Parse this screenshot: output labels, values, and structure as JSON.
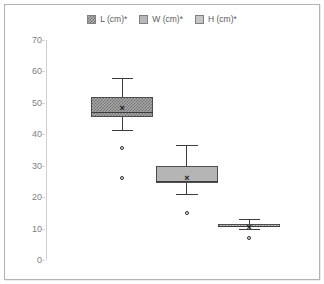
{
  "chart_data": {
    "type": "box",
    "title": "",
    "xlabel": "",
    "ylabel": "",
    "ylim": [
      0,
      70
    ],
    "ytick_labels": [
      "70",
      "60",
      "50",
      "40",
      "30",
      "20",
      "10",
      "0"
    ],
    "ytick_values": [
      70,
      60,
      50,
      40,
      30,
      20,
      10,
      0
    ],
    "grid": false,
    "legend_position": "top-center",
    "categories": [
      "L (cm)*",
      "W (cm)*",
      "H (cm)*"
    ],
    "series": [
      {
        "name": "L (cm)*",
        "whisker_low": 41.5,
        "q1": 45.5,
        "median": 47.0,
        "q3": 52.0,
        "whisker_high": 58.0,
        "mean": 48.5,
        "outliers": [
          35.5,
          26.0
        ],
        "fill": "#a8a8a8",
        "pattern": "checker"
      },
      {
        "name": "W (cm)*",
        "whisker_low": 21.0,
        "q1": 24.5,
        "median": 25.0,
        "q3": 30.0,
        "whisker_high": 36.5,
        "mean": 26.0,
        "outliers": [
          15.0
        ],
        "fill": "#b5b5b5",
        "pattern": "solid"
      },
      {
        "name": "H (cm)*",
        "whisker_low": 10.0,
        "q1": 10.4,
        "median": 10.8,
        "q3": 11.6,
        "whisker_high": 13.0,
        "mean": 10.5,
        "outliers": [
          7.0
        ],
        "fill": "#c2c2c2",
        "pattern": "vertical-lines"
      }
    ],
    "mean_marker": "×"
  },
  "legend": {
    "items": [
      {
        "label": "L (cm)*",
        "swatch": "legend-swatch-l"
      },
      {
        "label": "W (cm)*",
        "swatch": "legend-swatch-w"
      },
      {
        "label": "H (cm)*",
        "swatch": "legend-swatch-h"
      }
    ]
  },
  "colors": {
    "frame_border": "#b3b3b3",
    "axis": "#d0d0d0",
    "tick_text": "#808080",
    "box_outline": "#4d4d4d",
    "background": "#ffffff"
  }
}
